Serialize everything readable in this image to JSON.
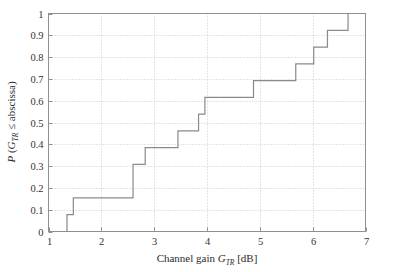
{
  "chart_data": {
    "type": "line",
    "subtype": "step-cdf",
    "title": "",
    "xlabel": "Channel gain G_TR [dB]",
    "ylabel": "P (G_TR ≤ abscissa)",
    "xlabel_parts": {
      "lead": "Channel gain ",
      "symbol": "G",
      "subscript": "TR",
      "trail": " [dB]"
    },
    "ylabel_parts": {
      "lead": "P (",
      "symbol": "G",
      "subscript": "TR",
      "trail": " ≤ abscissa)"
    },
    "xlim": [
      1,
      7
    ],
    "ylim": [
      0,
      1
    ],
    "xticks": [
      1,
      2,
      3,
      4,
      5,
      6,
      7
    ],
    "xticklabels": [
      "1",
      "2",
      "3",
      "4",
      "5",
      "6",
      "7"
    ],
    "yticks": [
      0,
      0.1,
      0.2,
      0.3,
      0.4,
      0.5,
      0.6,
      0.7,
      0.8,
      0.9,
      1
    ],
    "yticklabels": [
      "0",
      "0.1",
      "0.2",
      "0.3",
      "0.4",
      "0.5",
      "0.6",
      "0.7",
      "0.8",
      "0.9",
      "1"
    ],
    "grid": true,
    "grid_style": "dotted",
    "legend": "none",
    "series": [
      {
        "name": "Empirical CDF of channel gain",
        "x": [
          1.0,
          1.35,
          1.47,
          2.6,
          2.83,
          3.45,
          3.84,
          3.96,
          4.88,
          5.68,
          6.02,
          6.28,
          6.67,
          7.0
        ],
        "y": [
          0.0,
          0.077,
          0.154,
          0.308,
          0.385,
          0.462,
          0.538,
          0.615,
          0.692,
          0.769,
          0.846,
          0.923,
          1.0,
          1.0
        ]
      }
    ],
    "steps": [
      {
        "x": 1.35,
        "y_from": 0.0,
        "y_to": 0.077
      },
      {
        "x": 1.47,
        "y_from": 0.077,
        "y_to": 0.154
      },
      {
        "x": 2.6,
        "y_from": 0.154,
        "y_to": 0.308
      },
      {
        "x": 2.83,
        "y_from": 0.308,
        "y_to": 0.385
      },
      {
        "x": 3.45,
        "y_from": 0.385,
        "y_to": 0.462
      },
      {
        "x": 3.84,
        "y_from": 0.462,
        "y_to": 0.538
      },
      {
        "x": 3.96,
        "y_from": 0.538,
        "y_to": 0.615
      },
      {
        "x": 4.88,
        "y_from": 0.615,
        "y_to": 0.692
      },
      {
        "x": 5.68,
        "y_from": 0.692,
        "y_to": 0.769
      },
      {
        "x": 6.02,
        "y_from": 0.769,
        "y_to": 0.846
      },
      {
        "x": 6.28,
        "y_from": 0.846,
        "y_to": 0.923
      },
      {
        "x": 6.67,
        "y_from": 0.923,
        "y_to": 1.0
      }
    ],
    "colors": {
      "curve": "#8a8a8a",
      "grid": "#c8c8c8",
      "axis": "#8f8f8f",
      "text": "#2b2b2b",
      "background": "#ffffff"
    }
  }
}
